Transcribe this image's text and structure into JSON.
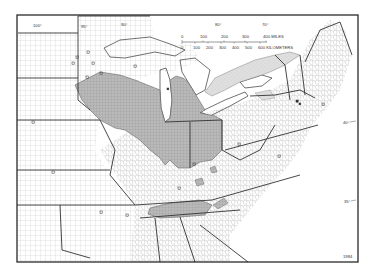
{
  "map": {
    "title": "",
    "figure_code": "1984",
    "colors": {
      "background": "#ffffff",
      "frame": "#2a2a2a",
      "shaded_region": "#b9b9b9",
      "stippled_region": "#dcdcdc",
      "lake_water": "#ffffff",
      "county_lines": "#9a9a9a",
      "state_lines": "#333333"
    },
    "longitude_labels": [
      "100°",
      "90°",
      "80°",
      "70°"
    ],
    "longitude_labels_inner": [
      "95°"
    ],
    "latitude_labels": [
      "40°",
      "35°"
    ],
    "scale_bar": {
      "miles_ticks": [
        "0",
        "100",
        "200",
        "300",
        "400 MILES"
      ],
      "km_ticks": [
        "0",
        "100",
        "200",
        "300",
        "400",
        "500",
        "600 KILOMETERS"
      ]
    },
    "legend_symbols": {
      "shaded": "gray crosshatch counties (core range)",
      "stippled": "light stippled area (Ontario lowlands)",
      "open_square": "isolated occurrence site",
      "filled_square": "isolated occurrence site (filled)"
    }
  }
}
